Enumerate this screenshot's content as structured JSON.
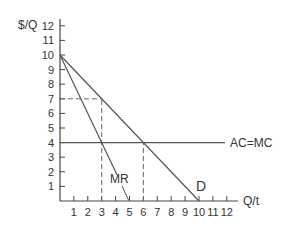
{
  "chart_data": {
    "type": "line",
    "title": "",
    "xlabel": "Q/t",
    "ylabel": "$/Q",
    "xlim": [
      0,
      12
    ],
    "ylim": [
      0,
      12
    ],
    "grid": false,
    "legend": "none (curves labeled inline)",
    "x_ticks": [
      "1",
      "2",
      "3",
      "4",
      "5",
      "6",
      "7",
      "8",
      "9",
      "10",
      "11",
      "12"
    ],
    "y_ticks": [
      "1",
      "2",
      "3",
      "4",
      "5",
      "6",
      "7",
      "8",
      "9",
      "10",
      "11",
      "12"
    ],
    "series": [
      {
        "name": "D",
        "label": "D",
        "points": [
          [
            0,
            10
          ],
          [
            10,
            0
          ]
        ]
      },
      {
        "name": "MR",
        "label": "MR",
        "points": [
          [
            0,
            10
          ],
          [
            5,
            0
          ]
        ]
      },
      {
        "name": "AC=MC",
        "label": "AC=MC",
        "points": [
          [
            0,
            4
          ],
          [
            11.8,
            4
          ]
        ]
      }
    ],
    "annotations": [
      {
        "type": "dashed-horizontal",
        "y": 7,
        "from_x": 0,
        "to_x": 3,
        "note": "Price at profit-maximizing output"
      },
      {
        "type": "dashed-vertical",
        "x": 3,
        "from_y": 0,
        "to_y": 7,
        "note": "Monopoly output where MR=MC"
      },
      {
        "type": "dashed-vertical",
        "x": 6,
        "from_y": 0,
        "to_y": 4,
        "note": "Competitive output where D=MC"
      },
      {
        "type": "leader-line",
        "label": "MR",
        "points_to": [
          5,
          0
        ]
      }
    ]
  },
  "labels": {
    "y_axis_title": "$/Q",
    "x_axis_title": "Q/t",
    "demand": "D",
    "marginal_revenue": "MR",
    "cost": "AC=MC"
  },
  "colors": {
    "axis": "#444444",
    "curve": "#555555",
    "dashed": "#666666",
    "text": "#333333",
    "background": "#ffffff"
  }
}
